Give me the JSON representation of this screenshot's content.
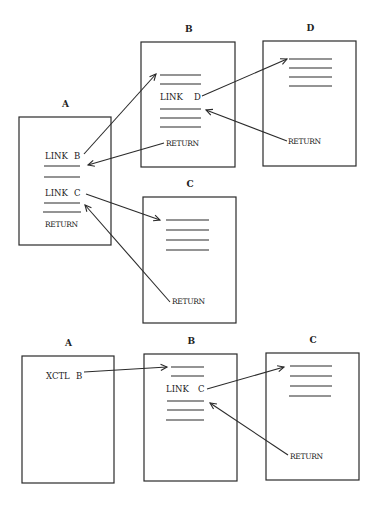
{
  "diagram": {
    "sections": [
      {
        "name": "link-return-flow",
        "boxes": [
          {
            "id": "A",
            "title": "A",
            "x": 19,
            "y": 117,
            "w": 92,
            "h": 128,
            "lines": [
              {
                "x1": 44,
                "x2": 80,
                "y": 166
              },
              {
                "x1": 44,
                "x2": 80,
                "y": 177
              },
              {
                "x1": 44,
                "x2": 80,
                "y": 203
              },
              {
                "x1": 43,
                "x2": 81,
                "y": 212
              }
            ],
            "labels": [
              {
                "text": "LINK",
                "x": 45,
                "y": 159,
                "cls": "lbl"
              },
              {
                "text": "B",
                "x": 74,
                "y": 159,
                "cls": "lbl"
              },
              {
                "text": "LINK",
                "x": 45,
                "y": 196,
                "cls": "lbl"
              },
              {
                "text": "C",
                "x": 74,
                "y": 196,
                "cls": "lbl"
              },
              {
                "text": "RETURN",
                "x": 45,
                "y": 227,
                "cls": "ret"
              }
            ]
          },
          {
            "id": "B",
            "title": "B",
            "x": 141,
            "y": 42,
            "w": 94,
            "h": 125,
            "lines": [
              {
                "x1": 160,
                "x2": 201,
                "y": 75
              },
              {
                "x1": 160,
                "x2": 201,
                "y": 84
              },
              {
                "x1": 160,
                "x2": 201,
                "y": 109
              },
              {
                "x1": 160,
                "x2": 201,
                "y": 118
              },
              {
                "x1": 160,
                "x2": 201,
                "y": 127
              }
            ],
            "labels": [
              {
                "text": "LINK",
                "x": 160,
                "y": 100,
                "cls": "lbl"
              },
              {
                "text": "D",
                "x": 194,
                "y": 100,
                "cls": "lbl"
              },
              {
                "text": "RETURN",
                "x": 166,
                "y": 146,
                "cls": "ret"
              }
            ]
          },
          {
            "id": "D",
            "title": "D",
            "x": 263,
            "y": 41,
            "w": 93,
            "h": 125,
            "lines": [
              {
                "x1": 289,
                "x2": 332,
                "y": 59
              },
              {
                "x1": 289,
                "x2": 332,
                "y": 68
              },
              {
                "x1": 289,
                "x2": 332,
                "y": 77
              },
              {
                "x1": 289,
                "x2": 332,
                "y": 86
              }
            ],
            "labels": [
              {
                "text": "RETURN",
                "x": 288,
                "y": 144,
                "cls": "ret"
              }
            ]
          },
          {
            "id": "C",
            "title": "C",
            "x": 143,
            "y": 197,
            "w": 93,
            "h": 126,
            "lines": [
              {
                "x1": 166,
                "x2": 209,
                "y": 220
              },
              {
                "x1": 166,
                "x2": 209,
                "y": 230
              },
              {
                "x1": 166,
                "x2": 209,
                "y": 240
              },
              {
                "x1": 166,
                "x2": 209,
                "y": 250
              }
            ],
            "labels": [
              {
                "text": "RETURN",
                "x": 172,
                "y": 304,
                "cls": "ret"
              }
            ]
          }
        ],
        "arrows": [
          {
            "label": "A-link-B-to-B",
            "x1": 84,
            "y1": 154,
            "x2": 156,
            "y2": 74
          },
          {
            "label": "B-return-to-A",
            "x1": 164,
            "y1": 143,
            "x2": 88,
            "y2": 165
          },
          {
            "label": "B-link-D-to-D",
            "x1": 202,
            "y1": 96,
            "x2": 287,
            "y2": 59
          },
          {
            "label": "D-return-to-B",
            "x1": 287,
            "y1": 141,
            "x2": 206,
            "y2": 110
          },
          {
            "label": "A-link-C-to-C",
            "x1": 86,
            "y1": 194,
            "x2": 160,
            "y2": 220
          },
          {
            "label": "C-return-to-A",
            "x1": 170,
            "y1": 302,
            "x2": 85,
            "y2": 205
          }
        ]
      },
      {
        "name": "xctl-flow",
        "boxes": [
          {
            "id": "A2",
            "title": "A",
            "x": 22,
            "y": 356,
            "w": 92,
            "h": 127,
            "lines": [],
            "labels": [
              {
                "text": "XCTL",
                "x": 46,
                "y": 379,
                "cls": "lbl"
              },
              {
                "text": "B",
                "x": 76,
                "y": 379,
                "cls": "lbl"
              }
            ]
          },
          {
            "id": "B2",
            "title": "B",
            "x": 144,
            "y": 354,
            "w": 93,
            "h": 127,
            "lines": [
              {
                "x1": 171,
                "x2": 204,
                "y": 367
              },
              {
                "x1": 171,
                "x2": 204,
                "y": 376
              },
              {
                "x1": 167,
                "x2": 204,
                "y": 401
              },
              {
                "x1": 167,
                "x2": 204,
                "y": 410
              },
              {
                "x1": 166,
                "x2": 204,
                "y": 420
              }
            ],
            "labels": [
              {
                "text": "LINK",
                "x": 166,
                "y": 392,
                "cls": "lbl"
              },
              {
                "text": "C",
                "x": 198,
                "y": 392,
                "cls": "lbl"
              }
            ]
          },
          {
            "id": "C2",
            "title": "C",
            "x": 266,
            "y": 353,
            "w": 93,
            "h": 127,
            "lines": [
              {
                "x1": 290,
                "x2": 332,
                "y": 366
              },
              {
                "x1": 290,
                "x2": 332,
                "y": 376
              },
              {
                "x1": 290,
                "x2": 332,
                "y": 386
              },
              {
                "x1": 289,
                "x2": 331,
                "y": 396
              }
            ],
            "labels": [
              {
                "text": "RETURN",
                "x": 290,
                "y": 459,
                "cls": "ret"
              }
            ]
          }
        ],
        "arrows": [
          {
            "label": "A-xctl-B-to-B",
            "x1": 84,
            "y1": 372,
            "x2": 167,
            "y2": 367
          },
          {
            "label": "B-link-C-to-C",
            "x1": 207,
            "y1": 389,
            "x2": 284,
            "y2": 367
          },
          {
            "label": "C-return-to-B",
            "x1": 288,
            "y1": 455,
            "x2": 210,
            "y2": 403
          }
        ]
      }
    ]
  }
}
